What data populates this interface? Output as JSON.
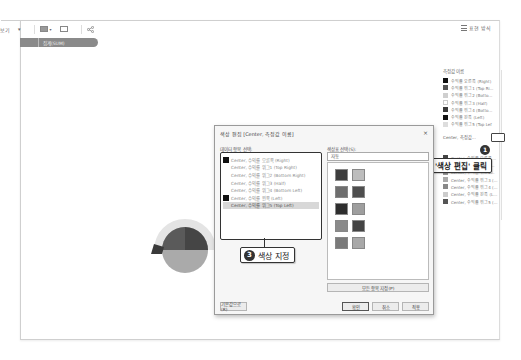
{
  "toolbar": {
    "item_left_label": "보기",
    "caret": "▾",
    "share_icon": "share-icon"
  },
  "tag_bar": {
    "label": "집계(SUM)"
  },
  "top_right": {
    "label": "표현 방식"
  },
  "legend": {
    "title": "측정값 이름",
    "items": [
      {
        "label": "수익률 오른쪽 (Right)",
        "color": "#111111"
      },
      {
        "label": "수익률 위그1 (Top Ri...",
        "color": "#555555"
      },
      {
        "label": "수익률 위그2 (Botto...",
        "color": "#cfcfcf"
      },
      {
        "label": "수익률 위그3 (Half)",
        "color": "#ffffff"
      },
      {
        "label": "수익률 위그4 (Botto...",
        "color": "#3a3a3a"
      },
      {
        "label": "수익률 왼쪽 (Left)",
        "color": "#111111"
      },
      {
        "label": "수익률 위그5 (Top Lef",
        "color": "#dddddd"
      }
    ],
    "sub_title": "Center, 측정값...",
    "sub_items": [
      {
        "label": "Center, 수익률 오른쪽...",
        "color": "#444444"
      },
      {
        "label": "Center, 수익률 위그1...",
        "color": "#777777"
      },
      {
        "label": "Center, 수익률 위그2...",
        "color": "#999999"
      },
      {
        "label": "Center, 수익률 위그3 (...",
        "color": "#aaaaaa"
      },
      {
        "label": "Center, 수익률 위그4 (...",
        "color": "#888888"
      },
      {
        "label": "Center, 수익률 왼쪽 (L...",
        "color": "#cccccc"
      },
      {
        "label": "Center, 수익률 위그5 (...",
        "color": "#555555"
      }
    ]
  },
  "callouts": {
    "c1": {
      "num": "1"
    },
    "c2": {
      "num": "2",
      "text": "'색상 편집' 클릭"
    },
    "c3": {
      "num": "3",
      "text": "색상 지정"
    }
  },
  "dialog": {
    "title": "색상 편집 [Center, 측정값 이름]",
    "close": "×",
    "left_label": "데이터 항목 선택:",
    "right_label": "색상표 선택(S):",
    "palette_value": "자동",
    "items": [
      {
        "label": "Center, 수익률 오른쪽 (Right)",
        "color": "#111111",
        "selected": false
      },
      {
        "label": "Center, 수익률 위그1 (Top Right)",
        "color": null,
        "selected": false
      },
      {
        "label": "Center, 수익률 위그2 (Bottom Right)",
        "color": null,
        "selected": false
      },
      {
        "label": "Center, 수익률 위그3 (Half)",
        "color": null,
        "selected": false
      },
      {
        "label": "Center, 수익률 위그4 (Bottom Left)",
        "color": null,
        "selected": false
      },
      {
        "label": "Center, 수익률 왼쪽 (Left)",
        "color": "#111111",
        "selected": false
      },
      {
        "label": "Center, 수익률 위그5 (Top Left)",
        "color": null,
        "selected": true
      }
    ],
    "palette": [
      "#3d3d3d",
      "#bdbdbd",
      "#6e6e6e",
      "#4e4e4e",
      "#2e2e2e",
      "#9e9e9e",
      "#8a8a8a",
      "#444444",
      "#7a7a7a",
      "#a8a8a8"
    ],
    "buttons": {
      "assign": "모든 항목 지정(P)",
      "reset": "기본값으로(R)",
      "ok": "확인",
      "cancel": "취소",
      "apply": "적용"
    }
  }
}
